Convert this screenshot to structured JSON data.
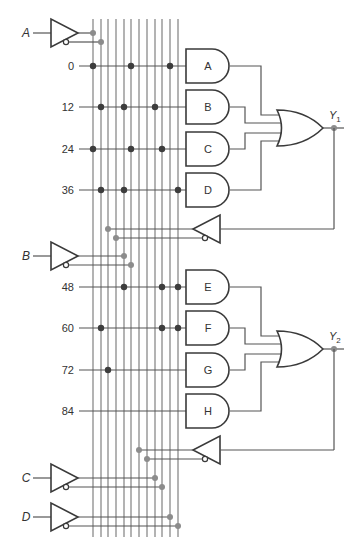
{
  "diagram": {
    "type": "PLA / programmable logic array schematic with feedback",
    "inputs": [
      {
        "label": "A",
        "y": 33,
        "true_line": 0,
        "comp_line": 1
      },
      {
        "label": "B",
        "y": 256,
        "true_line": 4,
        "comp_line": 5
      },
      {
        "label": "C",
        "y": 478,
        "true_line": 8,
        "comp_line": 9
      },
      {
        "label": "D",
        "y": 517,
        "true_line": 10,
        "comp_line": 11
      }
    ],
    "feedback": [
      {
        "from": "Y1",
        "y": 229,
        "true_line": 2,
        "comp_line": 3
      },
      {
        "from": "Y2",
        "y": 450,
        "true_line": 6,
        "comp_line": 7
      }
    ],
    "vertical_lines_x": [
      93,
      101,
      108,
      116,
      124,
      131,
      139,
      147,
      155,
      162,
      170,
      178
    ],
    "product_rows": [
      {
        "label": "0",
        "y": 66,
        "gate": "A",
        "dots": [
          0,
          5,
          10
        ]
      },
      {
        "label": "12",
        "y": 107,
        "gate": "B",
        "dots": [
          1,
          4,
          8
        ]
      },
      {
        "label": "24",
        "y": 149,
        "gate": "C",
        "dots": [
          0,
          5,
          9
        ]
      },
      {
        "label": "36",
        "y": 190,
        "gate": "D",
        "dots": [
          1,
          4,
          11
        ]
      },
      {
        "label": "48",
        "y": 287,
        "gate": "E",
        "dots": [
          4,
          9,
          11
        ]
      },
      {
        "label": "60",
        "y": 328,
        "gate": "F",
        "dots": [
          1,
          9,
          11
        ]
      },
      {
        "label": "72",
        "y": 370,
        "gate": "G",
        "dots": [
          2
        ]
      },
      {
        "label": "84",
        "y": 411,
        "gate": "H",
        "dots": []
      }
    ],
    "and_gates": [
      "A",
      "B",
      "C",
      "D",
      "E",
      "F",
      "G",
      "H"
    ],
    "outputs": [
      {
        "label": "Y",
        "subscript": "1",
        "or_inputs": [
          "A",
          "B",
          "C",
          "D"
        ]
      },
      {
        "label": "Y",
        "subscript": "2",
        "or_inputs": [
          "E",
          "F",
          "G",
          "H"
        ]
      }
    ]
  }
}
